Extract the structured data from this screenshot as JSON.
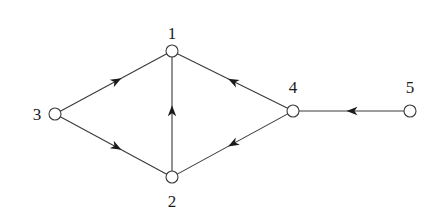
{
  "diagram": {
    "type": "directed-graph",
    "colors": {
      "stroke": "#3a3a3a",
      "arrow": "#1a1a1a",
      "node_fill": "#ffffff",
      "label": "#1a1a1a"
    },
    "nodes": [
      {
        "id": "1",
        "label": "1",
        "x": 172,
        "y": 51,
        "label_x": 172,
        "label_y": 39,
        "anchor": "middle"
      },
      {
        "id": "2",
        "label": "2",
        "x": 172,
        "y": 177,
        "label_x": 172,
        "label_y": 207,
        "anchor": "middle"
      },
      {
        "id": "3",
        "label": "3",
        "x": 55,
        "y": 114,
        "label_x": 37,
        "label_y": 120,
        "anchor": "middle"
      },
      {
        "id": "4",
        "label": "4",
        "x": 293,
        "y": 111,
        "label_x": 293,
        "label_y": 93,
        "anchor": "middle"
      },
      {
        "id": "5",
        "label": "5",
        "x": 410,
        "y": 111,
        "label_x": 410,
        "label_y": 93,
        "anchor": "middle"
      }
    ],
    "edges": [
      {
        "from": "3",
        "to": "1",
        "arrow_t": 0.53
      },
      {
        "from": "3",
        "to": "2",
        "arrow_t": 0.53
      },
      {
        "from": "2",
        "to": "1",
        "arrow_t": 0.53
      },
      {
        "from": "4",
        "to": "1",
        "arrow_t": 0.5
      },
      {
        "from": "4",
        "to": "2",
        "arrow_t": 0.5
      },
      {
        "from": "5",
        "to": "4",
        "arrow_t": 0.5
      }
    ]
  }
}
